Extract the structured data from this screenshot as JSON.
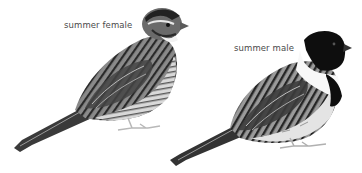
{
  "plate": {
    "background": "#ffffff",
    "figures": [
      {
        "id": "female",
        "label": "summer female",
        "label_pos": {
          "x": 64,
          "y": 20
        }
      },
      {
        "id": "male",
        "label": "summer male",
        "label_pos": {
          "x": 234,
          "y": 43
        }
      }
    ]
  }
}
